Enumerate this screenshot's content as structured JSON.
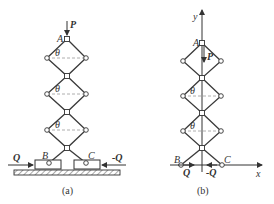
{
  "figure_a": {
    "caption": "(a)",
    "labels": {
      "force_top": "P",
      "apex": "A",
      "angle": "θ",
      "left_base": "B",
      "right_base": "C",
      "left_force": "Q",
      "right_force": "-Q"
    }
  },
  "figure_b": {
    "caption": "(b)",
    "labels": {
      "y_axis": "y",
      "x_axis": "x",
      "force_top": "P",
      "apex": "A",
      "angle": "θ",
      "left_base": "B",
      "right_base": "C",
      "left_force": "Q",
      "right_force": "-Q"
    }
  },
  "colors": {
    "line": "#3a3a3a",
    "dashed": "#9a9a9a",
    "background": "#ffffff"
  }
}
